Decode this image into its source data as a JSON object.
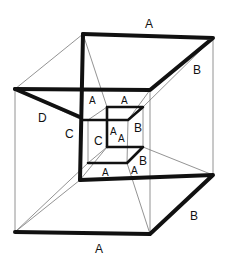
{
  "diagram": {
    "type": "hypercube-projection-sketch",
    "labels": {
      "outer_top": "A",
      "outer_right_top": "B",
      "outer_left": "D",
      "outer_c": "C",
      "outer_bottom": "A",
      "outer_right_bottom": "B",
      "inner_c": "C",
      "inner_a1": "A",
      "inner_a2": "A",
      "inner_a3": "A",
      "inner_a4": "A",
      "inner_a5": "A",
      "inner_a6": "A",
      "inner_b1": "B",
      "inner_b2": "B"
    }
  }
}
